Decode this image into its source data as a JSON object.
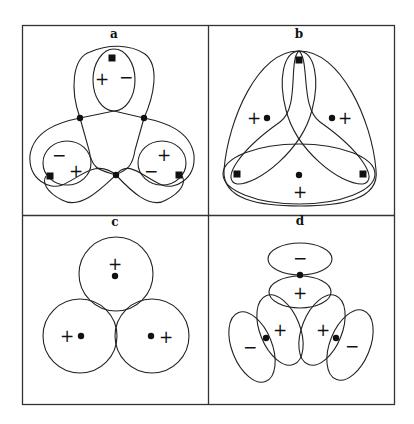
{
  "panels": [
    {
      "id": "a",
      "label": "a",
      "signs": [
        {
          "text": "+",
          "x": 102,
          "y": 79
        },
        {
          "text": "−",
          "x": 126,
          "y": 77
        },
        {
          "text": "−",
          "x": 59,
          "y": 155
        },
        {
          "text": "+",
          "x": 76,
          "y": 171
        },
        {
          "text": "+",
          "x": 164,
          "y": 155
        },
        {
          "text": "−",
          "x": 151,
          "y": 171
        }
      ],
      "nodes": [
        {
          "x": 80,
          "y": 118
        },
        {
          "x": 144,
          "y": 118
        },
        {
          "x": 116,
          "y": 175
        }
      ],
      "squares": [
        {
          "x": 112,
          "y": 58
        },
        {
          "x": 50,
          "y": 176
        },
        {
          "x": 179,
          "y": 175
        }
      ]
    },
    {
      "id": "b",
      "label": "b",
      "signs": [
        {
          "text": "+",
          "x": 254,
          "y": 118
        },
        {
          "text": "+",
          "x": 345,
          "y": 118
        },
        {
          "text": "+",
          "x": 300,
          "y": 192
        }
      ],
      "nodes": [
        {
          "x": 267,
          "y": 118
        },
        {
          "x": 332,
          "y": 118
        },
        {
          "x": 299,
          "y": 175
        }
      ],
      "squares": [
        {
          "x": 299,
          "y": 60
        },
        {
          "x": 237,
          "y": 174
        },
        {
          "x": 363,
          "y": 174
        }
      ]
    },
    {
      "id": "c",
      "label": "c",
      "signs": [
        {
          "text": "+",
          "x": 115,
          "y": 264
        },
        {
          "text": "+",
          "x": 67,
          "y": 336
        },
        {
          "text": "+",
          "x": 166,
          "y": 337
        }
      ],
      "nodes": [
        {
          "x": 115,
          "y": 276
        },
        {
          "x": 81,
          "y": 336
        },
        {
          "x": 151,
          "y": 336
        }
      ]
    },
    {
      "id": "d",
      "label": "d",
      "signs": [
        {
          "text": "−",
          "x": 300,
          "y": 258
        },
        {
          "text": "+",
          "x": 300,
          "y": 293
        },
        {
          "text": "+",
          "x": 280,
          "y": 330
        },
        {
          "text": "+",
          "x": 323,
          "y": 330
        },
        {
          "text": "−",
          "x": 250,
          "y": 347
        },
        {
          "text": "−",
          "x": 352,
          "y": 346
        }
      ],
      "nodes": [
        {
          "x": 300,
          "y": 275
        },
        {
          "x": 266,
          "y": 338
        },
        {
          "x": 336,
          "y": 338
        }
      ]
    }
  ]
}
